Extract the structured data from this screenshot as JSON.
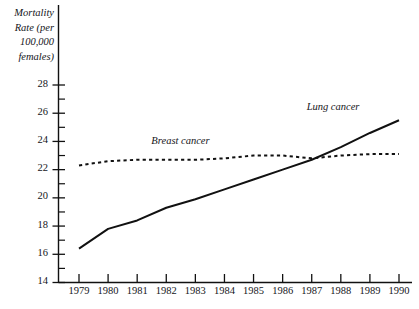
{
  "chart_data": {
    "type": "line",
    "title": "",
    "xlabel": "",
    "ylabel": "Mortality Rate (per 100,000 females)",
    "ylabel_lines": [
      "Mortality",
      "Rate (per",
      "100,000",
      "females)"
    ],
    "x": [
      1979,
      1980,
      1981,
      1982,
      1983,
      1984,
      1985,
      1986,
      1987,
      1988,
      1989,
      1990
    ],
    "categories": [
      "1979",
      "1980",
      "1981",
      "1982",
      "1983",
      "1984",
      "1985",
      "1986",
      "1987",
      "1988",
      "1989",
      "1990"
    ],
    "xlim": [
      1979,
      1990
    ],
    "ylim": [
      14,
      28
    ],
    "yticks": [
      14,
      16,
      18,
      20,
      22,
      24,
      26,
      28
    ],
    "ytick_labels": [
      "14",
      "16",
      "18",
      "20",
      "22",
      "24",
      "26",
      "28"
    ],
    "yminor_step": 1,
    "grid": false,
    "legend_position": "inline-annotation",
    "series": [
      {
        "name": "Lung cancer",
        "style": "solid",
        "color": "#111111",
        "label": "Lung cancer",
        "values": [
          16.4,
          17.8,
          18.4,
          19.3,
          19.9,
          20.6,
          21.3,
          22.0,
          22.7,
          23.6,
          24.6,
          25.5
        ]
      },
      {
        "name": "Breast cancer",
        "style": "dashed",
        "color": "#111111",
        "label": "Breast cancer",
        "values": [
          22.3,
          22.6,
          22.7,
          22.7,
          22.7,
          22.8,
          23.0,
          23.0,
          22.8,
          23.0,
          23.1,
          23.1
        ]
      }
    ],
    "annotations": [
      {
        "text": "Breast cancer",
        "x": 1983.0,
        "y": 23.9
      },
      {
        "text": "Lung cancer",
        "x": 1988.2,
        "y": 26.3
      }
    ]
  },
  "colors": {
    "axis": "#111111",
    "text": "#15151a",
    "background": "#ffffff"
  }
}
